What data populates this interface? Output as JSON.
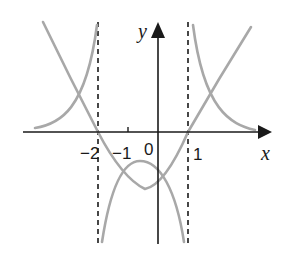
{
  "figure": {
    "axes": {
      "x_label": "x",
      "y_label": "y",
      "tick_labels": [
        "−2",
        "−1",
        "0",
        "1"
      ]
    },
    "asymptotes": [
      {
        "name": "x = -2",
        "x": -2
      },
      {
        "name": "x = 1",
        "x": 1
      }
    ],
    "colors": {
      "axes": "#1a1a1a",
      "curves": "#a8a8a8",
      "asymptotes": "#1a1a1a"
    },
    "curves": [
      {
        "name": "parabola",
        "description": "y = f(x), U-shaped, roots at x = -2 and x = 1, minimum near x = -0.5"
      },
      {
        "name": "reciprocal",
        "description": "y = 1/f(x), vertical asymptotes at x = -2 and x = 1, local maximum near x = -0.5, tends to 0 as |x| grows"
      }
    ]
  }
}
